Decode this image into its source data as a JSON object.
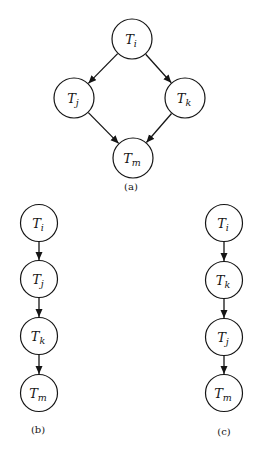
{
  "figure": {
    "colors": {
      "ink": "#151515",
      "paper": "#ffffff"
    },
    "node_radius": 19,
    "graphs": [
      {
        "id": "a",
        "caption": "(a)",
        "node_radius": 20,
        "nodes": [
          {
            "id": "Ti",
            "base": "T",
            "sub": "i",
            "x": 132,
            "y": 39
          },
          {
            "id": "Tj",
            "base": "T",
            "sub": "j",
            "x": 74,
            "y": 98
          },
          {
            "id": "Tk",
            "base": "T",
            "sub": "k",
            "x": 185,
            "y": 98
          },
          {
            "id": "Tm",
            "base": "T",
            "sub": "m",
            "x": 133,
            "y": 158
          }
        ],
        "edges": [
          {
            "from": "Ti",
            "to": "Tj"
          },
          {
            "from": "Ti",
            "to": "Tk"
          },
          {
            "from": "Tj",
            "to": "Tm"
          },
          {
            "from": "Tk",
            "to": "Tm"
          }
        ]
      },
      {
        "id": "b",
        "caption": "(b)",
        "node_radius": 18.5,
        "nodes": [
          {
            "id": "Ti",
            "base": "T",
            "sub": "i",
            "x": 39,
            "y": 223
          },
          {
            "id": "Tj",
            "base": "T",
            "sub": "j",
            "x": 39,
            "y": 279
          },
          {
            "id": "Tk",
            "base": "T",
            "sub": "k",
            "x": 39,
            "y": 336
          },
          {
            "id": "Tm",
            "base": "T",
            "sub": "m",
            "x": 39,
            "y": 393
          }
        ],
        "edges": [
          {
            "from": "Ti",
            "to": "Tj"
          },
          {
            "from": "Tj",
            "to": "Tk"
          },
          {
            "from": "Tk",
            "to": "Tm"
          }
        ]
      },
      {
        "id": "c",
        "caption": "(c)",
        "node_radius": 18.5,
        "nodes": [
          {
            "id": "Ti",
            "base": "T",
            "sub": "i",
            "x": 224,
            "y": 223
          },
          {
            "id": "Tk",
            "base": "T",
            "sub": "k",
            "x": 224,
            "y": 280
          },
          {
            "id": "Tj",
            "base": "T",
            "sub": "j",
            "x": 224,
            "y": 337
          },
          {
            "id": "Tm",
            "base": "T",
            "sub": "m",
            "x": 224,
            "y": 393
          }
        ],
        "edges": [
          {
            "from": "Ti",
            "to": "Tk"
          },
          {
            "from": "Tk",
            "to": "Tj"
          },
          {
            "from": "Tj",
            "to": "Tm"
          }
        ]
      }
    ]
  }
}
